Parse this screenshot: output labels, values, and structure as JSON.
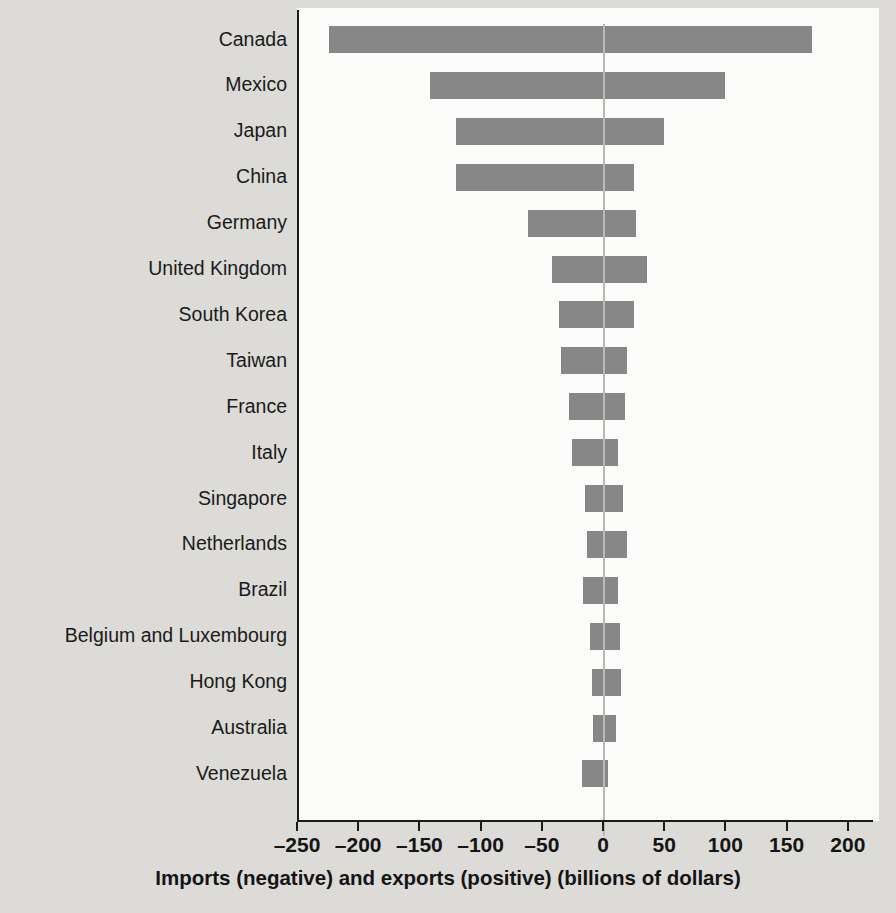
{
  "chart_data": {
    "type": "bar",
    "orientation": "horizontal",
    "title": "",
    "xlabel": "Imports (negative) and exports (positive) (billions of dollars)",
    "ylabel": "",
    "xlim": [
      -250,
      200
    ],
    "xticks": [
      -250,
      -200,
      -150,
      -100,
      -50,
      0,
      50,
      100,
      150,
      200
    ],
    "xticklabels": [
      "–250",
      "–200",
      "–150",
      "–100",
      "–50",
      "0",
      "50",
      "100",
      "150",
      "200"
    ],
    "grid": false,
    "legend": null,
    "zero_reference_line": true,
    "bar_color": "#878787",
    "plot_background": "#fbfbf9",
    "figure_background": "#dcdbd7",
    "categories": [
      "Canada",
      "Mexico",
      "Japan",
      "China",
      "Germany",
      "United Kingdom",
      "South Korea",
      "Taiwan",
      "France",
      "Italy",
      "Singapore",
      "Netherlands",
      "Brazil",
      "Belgium and Luxembourg",
      "Hong Kong",
      "Australia",
      "Venezuela"
    ],
    "series": [
      {
        "name": "Imports (negative)",
        "values": [
          -224,
          -141,
          -120,
          -120,
          -61,
          -42,
          -36,
          -34,
          -28,
          -25,
          -15,
          -13,
          -16,
          -11,
          -9,
          -8,
          -17
        ]
      },
      {
        "name": "Exports (positive)",
        "values": [
          171,
          100,
          50,
          25,
          27,
          36,
          25,
          20,
          18,
          12,
          16,
          20,
          12,
          14,
          15,
          11,
          4
        ]
      }
    ]
  }
}
